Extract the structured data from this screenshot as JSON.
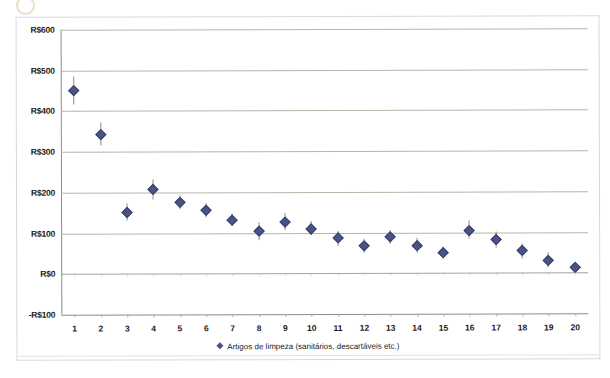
{
  "chart_data": {
    "type": "scatter",
    "title": "",
    "xlabel": "",
    "ylabel": "",
    "grid": true,
    "legend_position": "bottom",
    "ylim": [
      -100,
      600
    ],
    "ytick_labels": [
      "R$600",
      "R$500",
      "R$400",
      "R$300",
      "R$200",
      "R$100",
      "R$0",
      "-R$100"
    ],
    "ytick_values": [
      600,
      500,
      400,
      300,
      200,
      100,
      0,
      -100
    ],
    "categories": [
      "1",
      "2",
      "3",
      "4",
      "5",
      "6",
      "7",
      "8",
      "9",
      "10",
      "11",
      "12",
      "13",
      "14",
      "15",
      "16",
      "17",
      "18",
      "19",
      "20"
    ],
    "series": [
      {
        "name": "Artigos de limpeza (sanitários, descartáveis etc.)",
        "color": "#4a5384",
        "values": [
          449,
          341,
          151,
          206,
          175,
          155,
          131,
          104,
          127,
          110,
          86,
          66,
          88,
          68,
          49,
          105,
          81,
          54,
          31,
          12
        ],
        "error_low": [
          416,
          315,
          132,
          182,
          158,
          138,
          115,
          82,
          107,
          93,
          68,
          50,
          71,
          50,
          34,
          84,
          62,
          36,
          12,
          8
        ],
        "error_high": [
          484,
          371,
          172,
          231,
          193,
          172,
          148,
          126,
          148,
          129,
          105,
          83,
          106,
          87,
          65,
          128,
          101,
          73,
          50,
          16
        ]
      }
    ]
  },
  "legend": {
    "marker_icon": "diamond-marker-icon",
    "label": "Artigos de limpeza (sanitários, descartáveis etc.)"
  },
  "colors": {
    "marker": "#4a5384",
    "error_bar": "#8d8f7e",
    "gridline": "#b9b4a6",
    "axis": "#8c8c8c",
    "frame": "#d9d9d9",
    "text": "#1a1a1a"
  }
}
